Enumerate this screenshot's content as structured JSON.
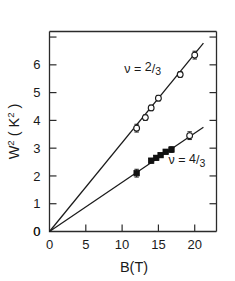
{
  "chart_data": {
    "type": "scatter",
    "title": "",
    "subtitle": "",
    "xlabel": "B(T)",
    "ylabel": "W",
    "ylabel_full": "W2 ( K2 )",
    "ylabel_base": "W",
    "ylabel_exp": "2",
    "ylabel_unit_open": "( K",
    "ylabel_unit_exp": "2",
    "ylabel_unit_close": " )",
    "xlim": [
      0,
      23
    ],
    "ylim": [
      0,
      7.2
    ],
    "xticks": [
      0,
      5,
      10,
      15,
      20
    ],
    "xticklabels": [
      "0",
      "5",
      "10",
      "15",
      "20"
    ],
    "yticks": [
      0,
      1,
      2,
      3,
      4,
      5,
      6,
      7
    ],
    "yticklabels": [
      "0",
      "1",
      "2",
      "3",
      "4",
      "5",
      "6",
      ""
    ],
    "grid": false,
    "legend_position": "inline-annotations",
    "series": [
      {
        "name": "nu = 2/3",
        "label_symbol": "ν",
        "label_equals": "=",
        "label_numerator": "2",
        "label_denominator": "3",
        "marker": "open-circle",
        "fit_slope": 0.32,
        "fit_intercept": 0,
        "fit_x": [
          0,
          21.2
        ],
        "x": [
          12.0,
          13.2,
          14.0,
          15.0,
          18.0,
          20.0
        ],
        "y": [
          3.72,
          4.1,
          4.45,
          4.8,
          5.65,
          6.35
        ],
        "yerr": [
          0.14,
          0.1,
          0.1,
          0.1,
          0.1,
          0.14
        ]
      },
      {
        "name": "nu = 4/3",
        "label_symbol": "ν",
        "label_equals": "=",
        "label_numerator": "4",
        "label_denominator": "3",
        "marker": "filled-square",
        "marker_last": "open-circle",
        "fit_slope": 0.177,
        "fit_intercept": 0,
        "fit_x": [
          0,
          21.2
        ],
        "x": [
          12.0,
          14.0,
          14.7,
          15.3,
          16.0,
          16.8,
          19.3
        ],
        "y": [
          2.1,
          2.55,
          2.65,
          2.75,
          2.87,
          2.95,
          3.45
        ],
        "yerr": [
          0.14,
          0.08,
          0.08,
          0.08,
          0.08,
          0.1,
          0.14
        ]
      }
    ],
    "annotations": [
      {
        "text": "ν = 2/3",
        "x": 10.3,
        "y": 5.72
      },
      {
        "text": "ν = 4/3",
        "x": 16.4,
        "y": 2.43
      }
    ],
    "origin_label": "0"
  }
}
